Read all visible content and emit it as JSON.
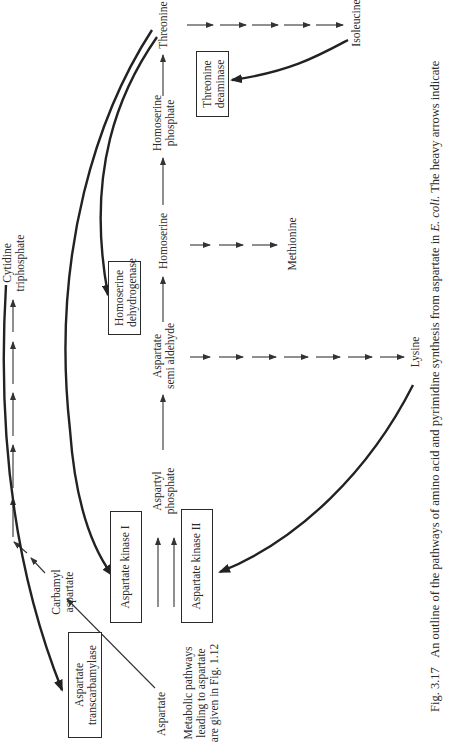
{
  "figure": {
    "caption_number": "Fig. 3.17",
    "caption_text_before_italic": "An outline of the pathways of amino acid and pyrimidine synthesis from aspartate in ",
    "caption_italic": "E. coli",
    "caption_text_after_italic": ". The heavy arrows indicate",
    "orientation": "rotated 90° counter-clockwise"
  },
  "metabolites": {
    "aspartate": "Aspartate",
    "carbamyl_aspartate": [
      "Carbamyl",
      "aspartate"
    ],
    "cytidine_triphosphate": [
      "Cytidine",
      "triphosphate"
    ],
    "aspartyl_phosphate": [
      "Aspartyl",
      "phosphate"
    ],
    "aspartate_semialdehyde": [
      "Aspartate",
      "semi aldehyde"
    ],
    "homoserine": "Homoserine",
    "homoserine_phosphate": [
      "Homoserine",
      "phosphate"
    ],
    "threonine": "Threonine",
    "isoleucine": "Isoleucine",
    "methionine": "Methionine",
    "lysine": "Lysine"
  },
  "enzymes": {
    "aspartate_transcarbamylase": [
      "Aspartate",
      "transcarbamylase"
    ],
    "aspartate_kinase_1": "Aspartate kinase I",
    "aspartate_kinase_2": "Aspartate kinase II",
    "homoserine_dehydrogenase": [
      "Homoserine",
      "dehydrogenase"
    ],
    "threonine_deaminase": [
      "Threonine",
      "deaminase"
    ]
  },
  "note": {
    "lines": [
      "Metabolic pathways",
      "leading to aspartate",
      "are given in Fig. 1.12"
    ]
  },
  "pathways": [
    {
      "from": "Aspartate",
      "to": "Carbamyl aspartate",
      "steps": 1
    },
    {
      "from": "Carbamyl aspartate",
      "to": "Cytidine triphosphate",
      "steps": 6
    },
    {
      "from": "Aspartate",
      "to": "Aspartyl phosphate",
      "enzymes": [
        "Aspartate kinase I",
        "Aspartate kinase II"
      ]
    },
    {
      "from": "Aspartyl phosphate",
      "to": "Aspartate semi aldehyde",
      "steps": 1
    },
    {
      "from": "Aspartate semi aldehyde",
      "to": "Homoserine",
      "enzyme": "Homoserine dehydrogenase"
    },
    {
      "from": "Homoserine",
      "to": "Homoserine phosphate",
      "steps": 1
    },
    {
      "from": "Homoserine phosphate",
      "to": "Threonine",
      "steps": 1
    },
    {
      "from": "Threonine",
      "to": "Isoleucine",
      "steps": 5,
      "enzyme": "Threonine deaminase"
    },
    {
      "from": "Homoserine",
      "to": "Methionine",
      "steps": 3
    },
    {
      "from": "Aspartate semi aldehyde",
      "to": "Lysine",
      "steps": 7
    }
  ],
  "feedback_inhibition": [
    {
      "inhibitor": "Cytidine triphosphate",
      "target": "Aspartate transcarbamylase"
    },
    {
      "inhibitor": "Threonine",
      "target": "Aspartate kinase I"
    },
    {
      "inhibitor": "Threonine",
      "target": "Homoserine dehydrogenase"
    },
    {
      "inhibitor": "Lysine",
      "target": "Aspartate kinase II"
    },
    {
      "inhibitor": "Isoleucine",
      "target": "Threonine deaminase"
    }
  ]
}
